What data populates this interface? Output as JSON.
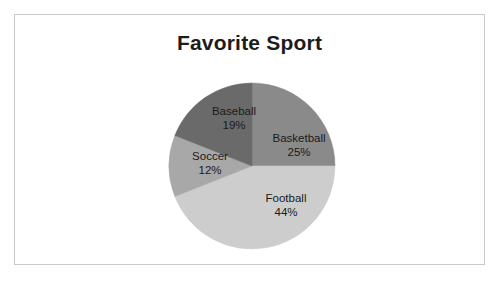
{
  "frame": {
    "border_color": "#c9c9c9",
    "background": "#ffffff"
  },
  "chart_data": {
    "type": "pie",
    "title": "Favorite Sport",
    "xlabel": "",
    "ylabel": "",
    "legend": "none",
    "start_angle_deg": 0,
    "direction": "clockwise",
    "categories": [
      "Basketball",
      "Football",
      "Soccer",
      "Baseball"
    ],
    "values": [
      25,
      44,
      12,
      19
    ],
    "value_unit": "%",
    "colors": [
      "#8a8a8a",
      "#cdcdcd",
      "#a8a8a8",
      "#6a6a6a"
    ],
    "slices": [
      {
        "name": "Basketball",
        "value": 25,
        "label": "Basketball",
        "percent_label": "25%",
        "color": "#8a8a8a",
        "label_x": 284,
        "label_y": 130
      },
      {
        "name": "Football",
        "value": 44,
        "label": "Football",
        "percent_label": "44%",
        "color": "#cdcdcd",
        "label_x": 271,
        "label_y": 190
      },
      {
        "name": "Soccer",
        "value": 12,
        "label": "Soccer",
        "percent_label": "12%",
        "color": "#a8a8a8",
        "label_x": 195,
        "label_y": 148
      },
      {
        "name": "Baseball",
        "value": 19,
        "label": "Baseball",
        "percent_label": "19%",
        "color": "#6a6a6a",
        "label_x": 219,
        "label_y": 103
      }
    ],
    "geometry": {
      "center_x": 237,
      "center_y": 151,
      "radius": 83
    }
  }
}
